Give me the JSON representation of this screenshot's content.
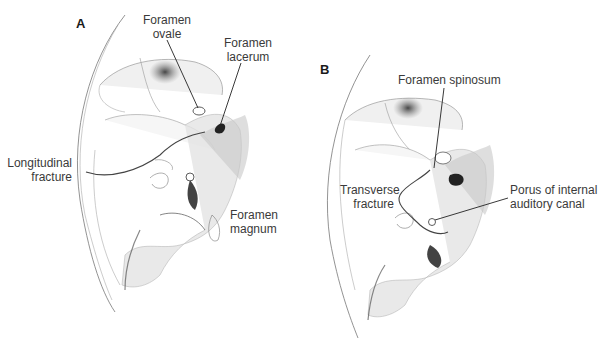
{
  "figure": {
    "panels": [
      {
        "id": "A",
        "letter": "A",
        "labels": {
          "foramen_ovale": [
            "Foramen",
            "ovale"
          ],
          "foramen_lacerum": [
            "Foramen",
            "lacerum"
          ],
          "longitudinal_fracture": [
            "Longitudinal",
            "fracture"
          ],
          "foramen_magnum": [
            "Foramen",
            "magnum"
          ]
        }
      },
      {
        "id": "B",
        "letter": "B",
        "labels": {
          "foramen_spinosum": [
            "Foramen spinosum"
          ],
          "transverse_fracture": [
            "Transverse",
            "fracture"
          ],
          "porus_internal_auditory_canal": [
            "Porus of internal",
            "auditory canal"
          ]
        }
      }
    ],
    "colors": {
      "line": "#333333",
      "shade_dark": "#2a2a2a",
      "shade_mid": "#8a8a8a",
      "shade_light": "#d8d8d8",
      "background": "#ffffff"
    }
  }
}
